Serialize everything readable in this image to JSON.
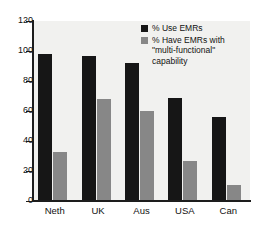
{
  "chart_data": {
    "type": "bar",
    "title": "",
    "subtitle": "",
    "xlabel": "",
    "ylabel": "",
    "ylim": [
      0,
      120
    ],
    "yticks": [
      0,
      20,
      40,
      60,
      80,
      100,
      120
    ],
    "ytick_labels": [
      "0",
      "20",
      "40",
      "60",
      "80",
      "100",
      "120"
    ],
    "grid": false,
    "legend_position": "top-right",
    "categories": [
      "Neth",
      "UK",
      "Aus",
      "USA",
      "Can"
    ],
    "series": [
      {
        "name": "% Use EMRs",
        "color": "#161616",
        "values": [
          98,
          97,
          92,
          69,
          56
        ]
      },
      {
        "name": "% Have EMRs with \"multi-functional\" capability",
        "color": "#878787",
        "values": [
          33,
          68,
          60,
          27,
          11
        ]
      }
    ]
  },
  "legend": {
    "entries": [
      {
        "label": "% Use EMRs",
        "color": "#161616"
      },
      {
        "label": "% Have EMRs with\n\"multi-functional\"\ncapability",
        "color": "#878787"
      }
    ]
  },
  "colors": {
    "series_dark": "#161616",
    "series_gray": "#878787",
    "plot_background": "#f1f1ef",
    "axis": "#1d1d1d",
    "text": "#111111",
    "page_background": "#ffffff"
  }
}
